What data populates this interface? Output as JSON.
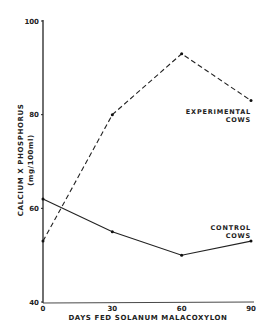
{
  "chart_data": {
    "type": "line",
    "title": "",
    "xlabel": "DAYS FED SOLANUM MALACOXYLON",
    "ylabel": "CALCIUM X PHOSPHORUS",
    "ylabel_units": "(mg/100ml)",
    "x": [
      0,
      30,
      60,
      90
    ],
    "x_ticks": [
      "0",
      "30",
      "60",
      "90"
    ],
    "y_ticks": [
      "40",
      "60",
      "80",
      "100"
    ],
    "xlim": [
      0,
      90
    ],
    "ylim": [
      40,
      100
    ],
    "grid": false,
    "legend": "inline labels at line ends",
    "series": [
      {
        "name": "EXPERIMENTAL COWS",
        "label_line1": "EXPERIMENTAL",
        "label_line2": "COWS",
        "style": "dashed",
        "values": [
          53,
          80,
          93,
          83
        ]
      },
      {
        "name": "CONTROL COWS",
        "label_line1": "CONTROL",
        "label_line2": "COWS",
        "style": "solid",
        "values": [
          62,
          55,
          50,
          53
        ]
      }
    ]
  }
}
